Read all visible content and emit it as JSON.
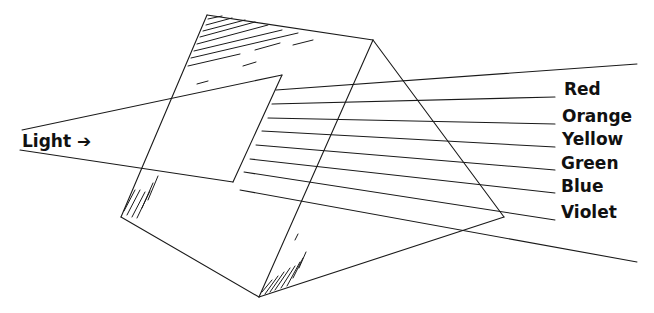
{
  "diagram": {
    "input_label": "Light ➔",
    "spectrum": [
      {
        "name": "Red",
        "y": 97
      },
      {
        "name": "Orange",
        "y": 124
      },
      {
        "name": "Yellow",
        "y": 147
      },
      {
        "name": "Green",
        "y": 170
      },
      {
        "name": "Blue",
        "y": 193
      },
      {
        "name": "Violet",
        "y": 220
      }
    ],
    "line_color": "#1a1a1a"
  }
}
